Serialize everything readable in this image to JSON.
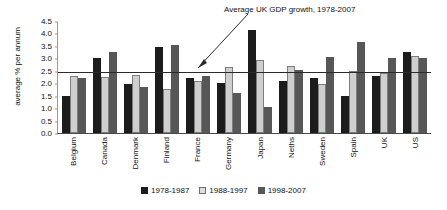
{
  "chart_data": {
    "type": "bar",
    "title": "",
    "xlabel": "",
    "ylabel": "average % per annum",
    "ylim": [
      0.0,
      4.5
    ],
    "yticks": [
      "0.0",
      "0.5",
      "1.0",
      "1.5",
      "2.0",
      "2.5",
      "3.0",
      "3.5",
      "4.0",
      "4.5"
    ],
    "grid": false,
    "legend_position": "bottom",
    "categories": [
      "Belgium",
      "Canada",
      "Denmark",
      "Finland",
      "France",
      "Germany",
      "Japan",
      "Neths",
      "Sweden",
      "Spain",
      "UK",
      "US"
    ],
    "series": [
      {
        "name": "1978-1987",
        "color": "#1c1c1c",
        "values": [
          1.5,
          3.0,
          1.95,
          3.45,
          2.2,
          2.0,
          4.15,
          2.1,
          2.2,
          1.5,
          2.3,
          3.25
        ]
      },
      {
        "name": "1988-1997",
        "color": "#cfcfcf",
        "values": [
          2.3,
          2.25,
          2.35,
          1.75,
          2.1,
          2.65,
          2.95,
          2.7,
          1.95,
          2.5,
          2.4,
          3.1
        ]
      },
      {
        "name": "1998-2007",
        "color": "#575757",
        "values": [
          2.2,
          3.25,
          1.85,
          3.55,
          2.3,
          1.6,
          1.05,
          2.55,
          3.05,
          3.65,
          3.0,
          3.0
        ]
      }
    ],
    "reference_line": {
      "label": "Average UK GDP growth, 1978-2007",
      "value": 2.4,
      "color": "#2b2b2b"
    }
  }
}
